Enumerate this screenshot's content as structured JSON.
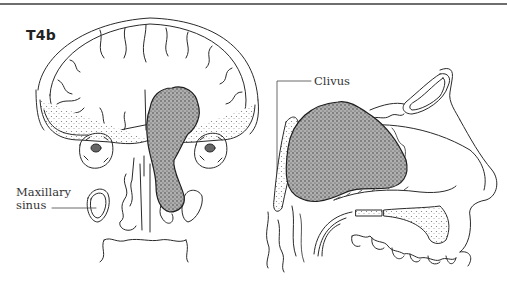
{
  "figure": {
    "stage_label": "T4b",
    "labels": {
      "maxillary_line1": "Maxillary",
      "maxillary_line2": "sinus",
      "clivus": "Clivus"
    },
    "views": [
      "coronal-section",
      "sagittal-section"
    ],
    "colors": {
      "ink": "#2a2a2a",
      "rule": "#6e6e6e",
      "tumor_fill": "#8a8a8a",
      "background": "#ffffff"
    }
  }
}
